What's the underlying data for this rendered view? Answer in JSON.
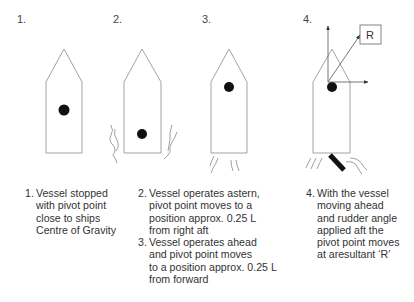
{
  "figure": {
    "panel_numbers": [
      "1.",
      "2.",
      "3.",
      "4."
    ],
    "resultant_label": "R",
    "colors": {
      "line": "#888888",
      "pivot": "#111111",
      "text": "#333333",
      "rudder": "#111111"
    }
  },
  "captions": {
    "c1": {
      "num": "1.",
      "text": "Vessel stopped\nwith pivot point\nclose to ships\nCentre of Gravity"
    },
    "c2": {
      "num": "2.",
      "text": "Vessel operates astern,\npivot point moves to a\nposition approx. 0.25 L\nfrom right aft"
    },
    "c3": {
      "num": "3.",
      "text": "Vessel operates ahead\nand pivot point moves\nto a position approx. 0.25 L\nfrom forward"
    },
    "c4": {
      "num": "4.",
      "text": "With the vessel\nmoving ahead\nand rudder angle\napplied aft the\npivot point moves\nat aresultant ‘R’"
    }
  }
}
